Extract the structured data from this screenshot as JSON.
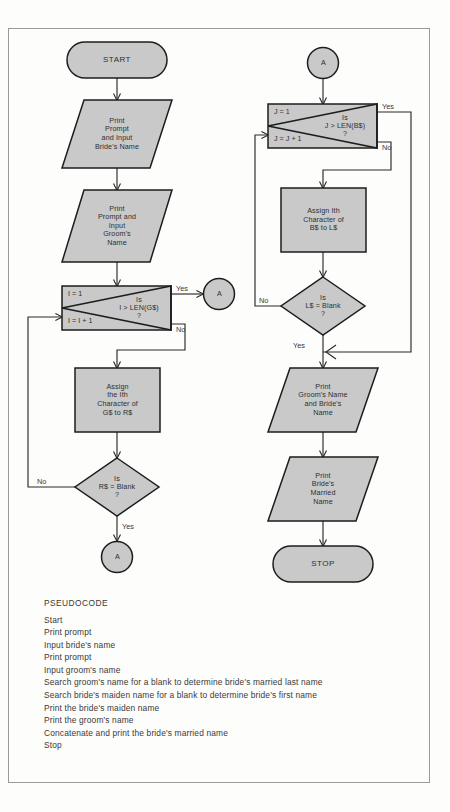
{
  "figure": {
    "type": "flowchart",
    "colors": {
      "shape_fill": "#c9c9c9",
      "shape_stroke": "#1d1d1d",
      "line": "#2a2a2a",
      "page_background": "#fdfdfb",
      "frame_border": "#9a9a9a",
      "text": "#2f2f2f"
    }
  },
  "flowchart": {
    "left_column": {
      "start": {
        "label": "START",
        "shape": "terminator"
      },
      "input_bride": {
        "label": "Print\nPrompt\nand Input\nBride's Name",
        "shape": "parallelogram"
      },
      "input_groom": {
        "label": "Print\nPrompt and\nInput\nGroom's\nName",
        "shape": "parallelogram"
      },
      "loop_groom": {
        "shape": "loop",
        "init": "I = 1",
        "increment": "I = I + 1",
        "condition": "Is\nI > LEN(G$)\n?",
        "yes_label": "Yes",
        "no_label": "No"
      },
      "assign_groom": {
        "label": "Assign\nthe Ith\nCharacter of\nG$ to R$",
        "shape": "process"
      },
      "decision_blank": {
        "label": "Is\nR$ = Blank\n?",
        "shape": "decision",
        "yes_label": "Yes",
        "no_label": "No"
      },
      "connector_yes": {
        "label": "A",
        "shape": "connector"
      },
      "connector_loop_exit": {
        "label": "A",
        "shape": "connector"
      }
    },
    "right_column": {
      "connector_in": {
        "label": "A",
        "shape": "connector"
      },
      "loop_bride": {
        "shape": "loop",
        "init": "J = 1",
        "increment": "J = J + 1",
        "condition": "Is\nJ > LEN(B$)\n?",
        "yes_label": "Yes",
        "no_label": "No"
      },
      "assign_bride": {
        "label": "Assign Ith\nCharacter of\nB$ to L$",
        "shape": "process"
      },
      "decision_blank": {
        "label": "Is\nL$ = Blank\n?",
        "shape": "decision",
        "yes_label": "Yes",
        "no_label": "No"
      },
      "print_names": {
        "label": "Print\nGroom's Name\nand Bride's\nName",
        "shape": "parallelogram"
      },
      "print_married": {
        "label": "Print\nBride's\nMarried\nName",
        "shape": "parallelogram"
      },
      "stop": {
        "label": "STOP",
        "shape": "terminator"
      }
    }
  },
  "pseudocode": {
    "heading": "PSEUDOCODE",
    "lines": [
      "Start",
      "Print prompt",
      "Input bride's name",
      "Print prompt",
      "Input groom's name",
      "Search groom's name for a blank to determine bride's married last name",
      "Search bride's maiden name for a blank to determine bride's first name",
      "Print the bride's maiden name",
      "Print the groom's name",
      "Concatenate and print the bride's married name",
      "Stop"
    ]
  }
}
